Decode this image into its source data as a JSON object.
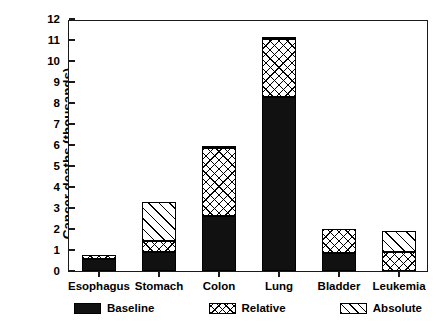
{
  "chart_data": {
    "type": "bar",
    "subtype": "stacked-bar",
    "title": "",
    "xlabel": "",
    "ylabel": "Cancer deaths (thousands)",
    "categories": [
      "Esophagus",
      "Stomach",
      "Colon",
      "Lung",
      "Bladder",
      "Leukemia"
    ],
    "series": [
      {
        "name": "Baseline",
        "pattern": "solid-black",
        "values": [
          0.55,
          0.9,
          2.6,
          8.3,
          0.85,
          0.0
        ]
      },
      {
        "name": "Relative",
        "pattern": "crosshatch",
        "values": [
          0.2,
          0.55,
          3.25,
          2.75,
          1.15,
          0.9
        ]
      },
      {
        "name": "Absolute",
        "pattern": "diagonal-hatch",
        "values": [
          0.0,
          1.85,
          0.1,
          0.05,
          0.0,
          1.0
        ]
      }
    ],
    "totals": [
      0.75,
      3.3,
      5.95,
      11.1,
      2.0,
      1.9
    ],
    "ylim": [
      0,
      12
    ],
    "yticks": [
      0,
      1,
      2,
      3,
      4,
      5,
      6,
      7,
      8,
      9,
      10,
      11,
      12
    ],
    "ytick_labels": [
      "0",
      "1",
      "2",
      "3",
      "4",
      "5",
      "6",
      "7",
      "8",
      "9",
      "10",
      "11",
      "12"
    ],
    "grid": false,
    "legend_position": "bottom",
    "legend": [
      "Baseline",
      "Relative",
      "Absolute"
    ],
    "colors": {
      "baseline": "#111111",
      "relative": "#ffffff",
      "absolute": "#ffffff",
      "outline": "#000000"
    }
  }
}
